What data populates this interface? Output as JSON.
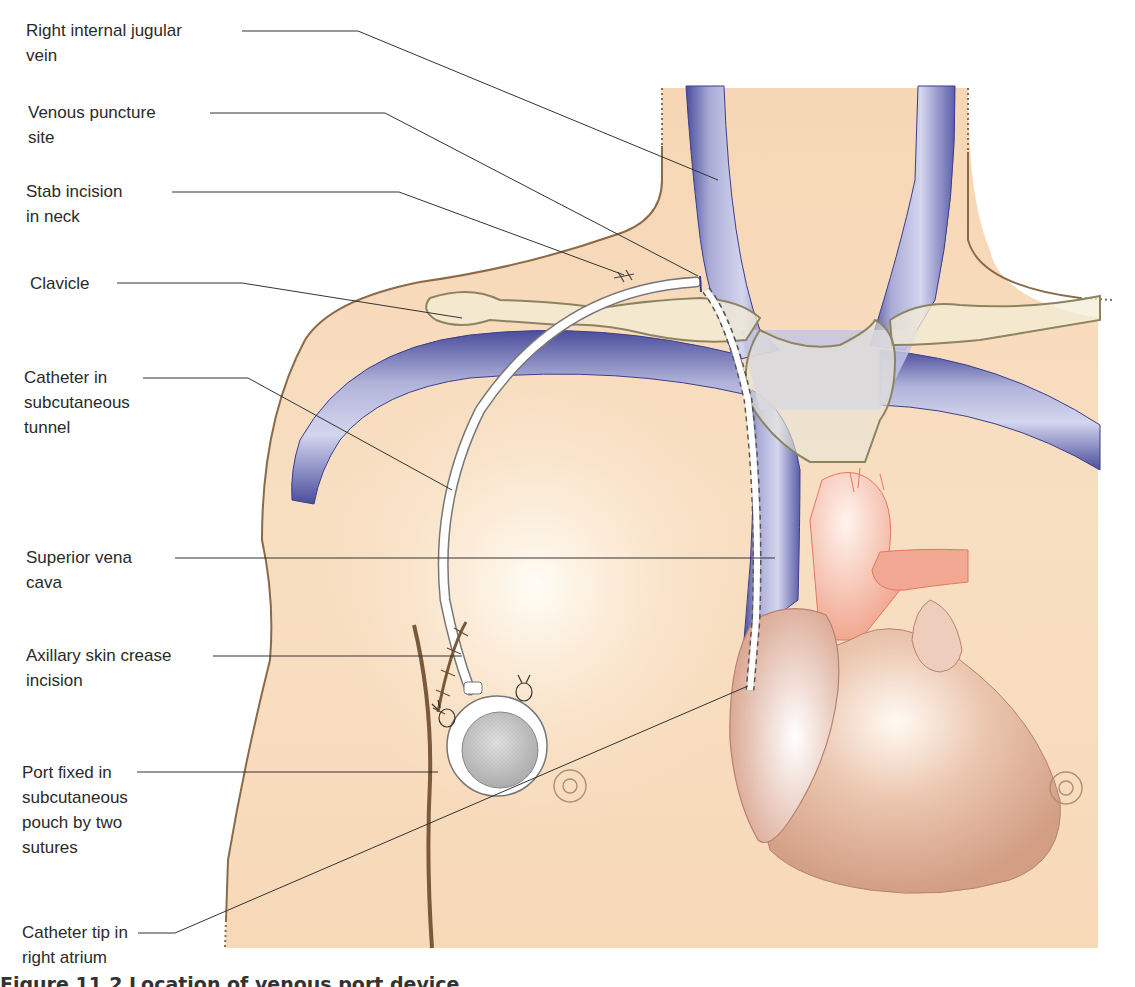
{
  "figure": {
    "caption": "Figure 11.2 Location of venous port device",
    "colors": {
      "skin": "#f8dcbc",
      "skin_outline": "#8a6a48",
      "vein": "#9a9ccc",
      "vein_edge": "#3a3d8c",
      "clavicle_fill": "#f3ecd6",
      "clavicle_outline": "#8c8460",
      "heart_upper": "#f3b7a6",
      "heart_lower": "#d9a58a",
      "heart_outline": "#e07a5c",
      "leader_line": "#333333",
      "label_text": "#2a2a2a"
    }
  },
  "labels": [
    {
      "id": "right-internal-jugular-vein",
      "text": "Right internal jugular\nvein"
    },
    {
      "id": "venous-puncture-site",
      "text": "Venous puncture\nsite"
    },
    {
      "id": "stab-incision-in-neck",
      "text": "Stab incision\nin neck"
    },
    {
      "id": "clavicle",
      "text": "Clavicle"
    },
    {
      "id": "catheter-in-subcutaneous-tunnel",
      "text": "Catheter in\nsubcutaneous\ntunnel"
    },
    {
      "id": "superior-vena-cava",
      "text": "Superior vena\ncava"
    },
    {
      "id": "axillary-skin-crease-incision",
      "text": "Axillary skin crease\nincision"
    },
    {
      "id": "port-fixed-in-subcutaneous-pouch",
      "text": "Port fixed in\nsubcutaneous\npouch by two\nsutures"
    },
    {
      "id": "catheter-tip-in-right-atrium",
      "text": "Catheter tip in\nright atrium"
    }
  ]
}
